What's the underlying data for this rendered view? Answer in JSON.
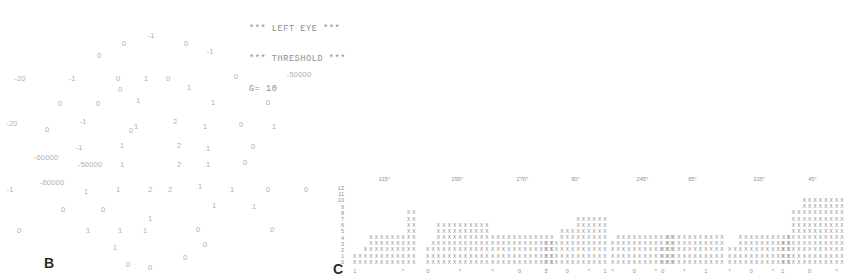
{
  "header": {
    "line1": "*** LEFT EYE ***",
    "line2": "*** THRESHOLD ***",
    "line3": "G= 10"
  },
  "panel_b": {
    "label": "B",
    "points": [
      {
        "x": 151,
        "y": 36,
        "value": "-1"
      },
      {
        "x": 124,
        "y": 44,
        "value": "0"
      },
      {
        "x": 186,
        "y": 44,
        "value": "0"
      },
      {
        "x": 99,
        "y": 56,
        "value": "0"
      },
      {
        "x": 210,
        "y": 52,
        "value": "-1"
      },
      {
        "x": 20,
        "y": 79,
        "value": "-20"
      },
      {
        "x": 72,
        "y": 79,
        "value": "-1"
      },
      {
        "x": 118,
        "y": 79,
        "value": "0"
      },
      {
        "x": 146,
        "y": 79,
        "value": "1"
      },
      {
        "x": 168,
        "y": 79,
        "value": "0"
      },
      {
        "x": 236,
        "y": 77,
        "value": "0"
      },
      {
        "x": 299,
        "y": 75,
        "value": "-50000"
      },
      {
        "x": 120,
        "y": 90,
        "value": "0"
      },
      {
        "x": 189,
        "y": 88,
        "value": "1"
      },
      {
        "x": 60,
        "y": 104,
        "value": "0"
      },
      {
        "x": 98,
        "y": 104,
        "value": "0"
      },
      {
        "x": 138,
        "y": 101,
        "value": "1"
      },
      {
        "x": 213,
        "y": 103,
        "value": "1"
      },
      {
        "x": 268,
        "y": 103,
        "value": "0"
      },
      {
        "x": 12,
        "y": 124,
        "value": "-20"
      },
      {
        "x": 47,
        "y": 130,
        "value": "0"
      },
      {
        "x": 83,
        "y": 122,
        "value": "-1"
      },
      {
        "x": 136,
        "y": 127,
        "value": "1"
      },
      {
        "x": 175,
        "y": 122,
        "value": "2"
      },
      {
        "x": 205,
        "y": 127,
        "value": "1"
      },
      {
        "x": 241,
        "y": 125,
        "value": "0"
      },
      {
        "x": 274,
        "y": 127,
        "value": "1"
      },
      {
        "x": 131,
        "y": 131,
        "value": "0"
      },
      {
        "x": 79,
        "y": 148,
        "value": "-1"
      },
      {
        "x": 122,
        "y": 146,
        "value": "1"
      },
      {
        "x": 179,
        "y": 146,
        "value": "2"
      },
      {
        "x": 208,
        "y": 149,
        "value": "1"
      },
      {
        "x": 253,
        "y": 147,
        "value": "0"
      },
      {
        "x": 46,
        "y": 158,
        "value": "-60000"
      },
      {
        "x": 90,
        "y": 165,
        "value": "-50000"
      },
      {
        "x": 122,
        "y": 165,
        "value": "1"
      },
      {
        "x": 179,
        "y": 165,
        "value": "2"
      },
      {
        "x": 208,
        "y": 165,
        "value": "1"
      },
      {
        "x": 245,
        "y": 163,
        "value": "0"
      },
      {
        "x": 52,
        "y": 183,
        "value": "-60000"
      },
      {
        "x": 10,
        "y": 190,
        "value": "-1"
      },
      {
        "x": 86,
        "y": 192,
        "value": "1"
      },
      {
        "x": 118,
        "y": 190,
        "value": "1"
      },
      {
        "x": 150,
        "y": 190,
        "value": "2"
      },
      {
        "x": 170,
        "y": 190,
        "value": "2"
      },
      {
        "x": 200,
        "y": 187,
        "value": "1"
      },
      {
        "x": 232,
        "y": 190,
        "value": "1"
      },
      {
        "x": 268,
        "y": 190,
        "value": "0"
      },
      {
        "x": 306,
        "y": 190,
        "value": "0"
      },
      {
        "x": 63,
        "y": 210,
        "value": "0"
      },
      {
        "x": 103,
        "y": 210,
        "value": "0"
      },
      {
        "x": 214,
        "y": 206,
        "value": "1"
      },
      {
        "x": 254,
        "y": 207,
        "value": "1"
      },
      {
        "x": 150,
        "y": 219,
        "value": "1"
      },
      {
        "x": 88,
        "y": 231,
        "value": "1"
      },
      {
        "x": 19,
        "y": 231,
        "value": "0"
      },
      {
        "x": 120,
        "y": 231,
        "value": "1"
      },
      {
        "x": 145,
        "y": 231,
        "value": "1"
      },
      {
        "x": 198,
        "y": 230,
        "value": "0"
      },
      {
        "x": 272,
        "y": 230,
        "value": "0"
      },
      {
        "x": 115,
        "y": 248,
        "value": "1"
      },
      {
        "x": 205,
        "y": 245,
        "value": "0"
      },
      {
        "x": 128,
        "y": 265,
        "value": "0"
      },
      {
        "x": 150,
        "y": 268,
        "value": "0"
      },
      {
        "x": 185,
        "y": 258,
        "value": "0"
      }
    ]
  },
  "panel_c": {
    "label": "C",
    "y_axis": [
      "12",
      "11",
      "10",
      "9",
      "8",
      "7",
      "6",
      "5",
      "4",
      "3",
      "2",
      "1",
      "0"
    ],
    "groups": [
      {
        "header": "115°",
        "left": 22,
        "columns": [
          2,
          2,
          3,
          5,
          5,
          5,
          5,
          5,
          5,
          5,
          9,
          9
        ],
        "footer": [
          "1",
          "",
          "",
          "",
          "",
          "",
          "",
          "",
          "",
          "*",
          "",
          ""
        ]
      },
      {
        "header": "295°",
        "left": 95,
        "columns": [
          3,
          4,
          7,
          7,
          7,
          7,
          7,
          7,
          7,
          7,
          7,
          7
        ],
        "footer": [
          "0",
          "",
          "",
          "",
          "",
          "",
          "*",
          "",
          "",
          "",
          "",
          ""
        ]
      },
      {
        "header": "270°",
        "left": 160,
        "columns": [
          5,
          5,
          5,
          5,
          5,
          5,
          5,
          5,
          5,
          5,
          5,
          5
        ],
        "footer": [
          "*",
          "",
          "",
          "",
          "",
          "0",
          "",
          "",
          "",
          "",
          "*",
          ""
        ]
      },
      {
        "header": "90°",
        "left": 213,
        "columns": [
          4,
          4,
          4,
          6,
          6,
          6,
          8,
          8,
          8,
          8,
          8,
          8
        ],
        "footer": [
          "1",
          "",
          "",
          "",
          "0",
          "",
          "",
          "",
          "*",
          "",
          "",
          "1"
        ]
      },
      {
        "header": "245°",
        "left": 280,
        "columns": [
          4,
          5,
          5,
          5,
          5,
          5,
          5,
          5,
          5,
          5,
          5,
          5
        ],
        "footer": [
          "*",
          "",
          "",
          "",
          "0",
          "",
          "",
          "",
          "*",
          "",
          "",
          ""
        ]
      },
      {
        "header": "65°",
        "left": 330,
        "columns": [
          3,
          5,
          5,
          5,
          5,
          5,
          5,
          5,
          5,
          5,
          5,
          5
        ],
        "footer": [
          "0",
          "",
          "",
          "",
          "*",
          "",
          "",
          "",
          "1",
          "",
          "",
          ""
        ]
      },
      {
        "header": "225°",
        "left": 397,
        "columns": [
          3,
          3,
          5,
          5,
          5,
          5,
          5,
          5,
          5,
          5,
          5,
          5
        ],
        "footer": [
          "*",
          "",
          "",
          "",
          "0",
          "",
          "",
          "",
          "*",
          "",
          "",
          ""
        ]
      },
      {
        "header": "45°",
        "left": 450,
        "columns": [
          4,
          5,
          9,
          9,
          11,
          11,
          11,
          11,
          11,
          11,
          11,
          11
        ],
        "footer": [
          "1",
          "",
          "",
          "",
          "",
          "0",
          "",
          "",
          "",
          "",
          "*",
          ""
        ]
      }
    ],
    "cell_glyph": "X",
    "asterisk_glyph": "*"
  }
}
